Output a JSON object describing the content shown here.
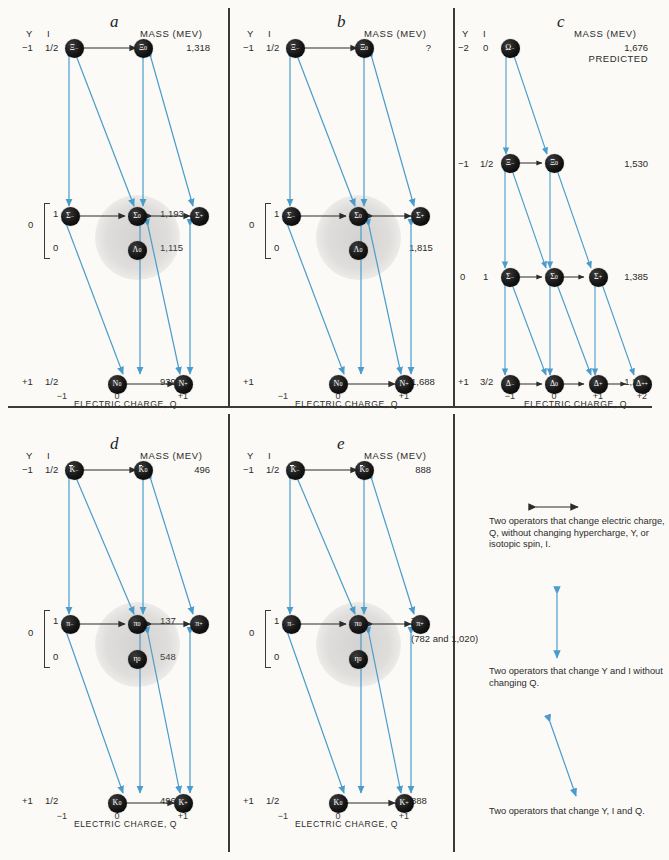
{
  "figure": {
    "background": "#fbfaf7",
    "arrow_blue": "#4a9ccc",
    "arrow_black": "#2b2b2b",
    "node_fill": "#101010"
  },
  "common": {
    "y_header": "Y",
    "i_header": "I",
    "mass_header": "MASS (MEV)",
    "axis_title": "ELECTRIC CHARGE, Q",
    "ticks_3": [
      "−1",
      "0",
      "+1"
    ],
    "ticks_4": [
      "−1",
      "0",
      "+1",
      "+2"
    ]
  },
  "panels": [
    {
      "id": "a",
      "label": "a",
      "rows": [
        {
          "y": "−1",
          "i": "1/2",
          "mass": "1,318",
          "nodes": [
            {
              "q": 0,
              "sym": "Ξ",
              "charge": "−",
              "bar": false
            },
            {
              "q": 1,
              "sym": "Ξ",
              "charge": "0",
              "bar": false
            }
          ]
        },
        {
          "y": "0",
          "i": "1",
          "mass": "1,193",
          "nodes": [
            {
              "q": -1,
              "sym": "Σ",
              "charge": "−",
              "bar": false
            },
            {
              "q": 0,
              "sym": "Σ",
              "charge": "0",
              "bar": false
            },
            {
              "q": 1,
              "sym": "Σ",
              "charge": "+",
              "bar": false
            }
          ]
        },
        {
          "y": "",
          "i": "0",
          "mass": "1,115",
          "nodes": [
            {
              "q": 0,
              "sym": "Λ",
              "charge": "0",
              "bar": false
            }
          ]
        },
        {
          "y": "+1",
          "i": "1/2",
          "mass": "939",
          "nodes": [
            {
              "q": 0,
              "sym": "N",
              "charge": "0",
              "bar": false
            },
            {
              "q": 1,
              "sym": "N",
              "charge": "+",
              "bar": false
            }
          ]
        }
      ]
    },
    {
      "id": "b",
      "label": "b",
      "rows": [
        {
          "y": "−1",
          "i": "1/2",
          "mass": "?",
          "nodes": [
            {
              "q": 0,
              "sym": "Ξ",
              "charge": "−",
              "bar": false
            },
            {
              "q": 1,
              "sym": "Ξ",
              "charge": "0",
              "bar": false
            }
          ]
        },
        {
          "y": "0",
          "i": "1",
          "mass": "?",
          "nodes": [
            {
              "q": -1,
              "sym": "Σ",
              "charge": "−",
              "bar": false
            },
            {
              "q": 0,
              "sym": "Σ",
              "charge": "0",
              "bar": false
            },
            {
              "q": 1,
              "sym": "Σ",
              "charge": "+",
              "bar": false
            }
          ]
        },
        {
          "y": "",
          "i": "0",
          "mass": "1,815",
          "nodes": [
            {
              "q": 0,
              "sym": "Λ",
              "charge": "0",
              "bar": false
            }
          ]
        },
        {
          "y": "+1",
          "i": "",
          "mass": "1,688",
          "nodes": [
            {
              "q": 0,
              "sym": "N",
              "charge": "0",
              "bar": false
            },
            {
              "q": 1,
              "sym": "N",
              "charge": "+",
              "bar": false
            }
          ]
        }
      ]
    },
    {
      "id": "c",
      "label": "c",
      "predicted_note": "PREDICTED",
      "rows": [
        {
          "y": "−2",
          "i": "0",
          "mass": "1,676",
          "nodes": [
            {
              "q": -1,
              "sym": "Ω",
              "charge": "−",
              "bar": false
            }
          ]
        },
        {
          "y": "−1",
          "i": "1/2",
          "mass": "1,530",
          "nodes": [
            {
              "q": -1,
              "sym": "Ξ",
              "charge": "−",
              "bar": false
            },
            {
              "q": 0,
              "sym": "Ξ",
              "charge": "0",
              "bar": false
            }
          ]
        },
        {
          "y": "0",
          "i": "1",
          "mass": "1,385",
          "nodes": [
            {
              "q": -1,
              "sym": "Σ",
              "charge": "−",
              "bar": false
            },
            {
              "q": 0,
              "sym": "Σ",
              "charge": "0",
              "bar": false
            },
            {
              "q": 1,
              "sym": "Σ",
              "charge": "+",
              "bar": false
            }
          ]
        },
        {
          "y": "+1",
          "i": "3/2",
          "mass": "1,238",
          "nodes": [
            {
              "q": -1,
              "sym": "Δ",
              "charge": "−",
              "bar": false
            },
            {
              "q": 0,
              "sym": "Δ",
              "charge": "0",
              "bar": false
            },
            {
              "q": 1,
              "sym": "Δ",
              "charge": "+",
              "bar": false
            },
            {
              "q": 2,
              "sym": "Δ",
              "charge": "++",
              "bar": false
            }
          ]
        }
      ]
    },
    {
      "id": "d",
      "label": "d",
      "rows": [
        {
          "y": "−1",
          "i": "1/2",
          "mass": "496",
          "nodes": [
            {
              "q": 0,
              "sym": "K",
              "charge": "−",
              "bar": true
            },
            {
              "q": 1,
              "sym": "K",
              "charge": "0",
              "bar": true
            }
          ]
        },
        {
          "y": "0",
          "i": "1",
          "mass": "137",
          "nodes": [
            {
              "q": -1,
              "sym": "π",
              "charge": "−",
              "bar": false
            },
            {
              "q": 0,
              "sym": "π",
              "charge": "0",
              "bar": false
            },
            {
              "q": 1,
              "sym": "π",
              "charge": "+",
              "bar": false
            }
          ]
        },
        {
          "y": "",
          "i": "0",
          "mass": "548",
          "nodes": [
            {
              "q": 0,
              "sym": "η",
              "charge": "0",
              "bar": false
            }
          ]
        },
        {
          "y": "+1",
          "i": "1/2",
          "mass": "496",
          "nodes": [
            {
              "q": 0,
              "sym": "K",
              "charge": "0",
              "bar": false
            },
            {
              "q": 1,
              "sym": "K",
              "charge": "+",
              "bar": false
            }
          ]
        }
      ]
    },
    {
      "id": "e",
      "label": "e",
      "rows": [
        {
          "y": "−1",
          "i": "1/2",
          "mass": "888",
          "nodes": [
            {
              "q": 0,
              "sym": "K",
              "charge": "−",
              "bar": true
            },
            {
              "q": 1,
              "sym": "K",
              "charge": "0",
              "bar": true
            }
          ]
        },
        {
          "y": "0",
          "i": "1",
          "mass": "750",
          "nodes": [
            {
              "q": -1,
              "sym": "π",
              "charge": "−",
              "bar": false
            },
            {
              "q": 0,
              "sym": "π",
              "charge": "0",
              "bar": false
            },
            {
              "q": 1,
              "sym": "π",
              "charge": "+",
              "bar": false
            }
          ]
        },
        {
          "y": "",
          "i": "0",
          "mass": "(782 and 1,020)",
          "nodes": [
            {
              "q": 0,
              "sym": "η",
              "charge": "0",
              "bar": false
            }
          ]
        },
        {
          "y": "+1",
          "i": "1/2",
          "mass": "888",
          "nodes": [
            {
              "q": 0,
              "sym": "K",
              "charge": "0",
              "bar": false
            },
            {
              "q": 1,
              "sym": "K",
              "charge": "+",
              "bar": false
            }
          ]
        }
      ]
    }
  ],
  "legend": [
    {
      "key": "horizontal-black-double-arrow",
      "text": "Two operators that change electric charge, Q, without changing hypercharge, Y, or isotopic spin, I."
    },
    {
      "key": "vertical-blue-double-arrow",
      "text": "Two operators that change Y and I without changing Q."
    },
    {
      "key": "diagonal-blue-double-arrow",
      "text": "Two operators that change Y, I and Q."
    }
  ]
}
